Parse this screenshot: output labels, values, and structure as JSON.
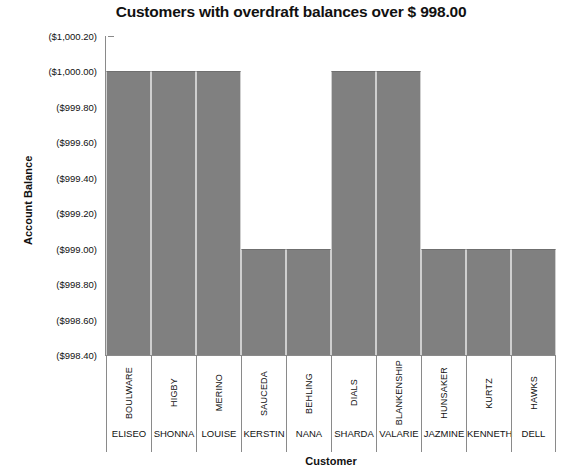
{
  "chart_data": {
    "type": "bar",
    "title": "Customers with overdraft balances over $ 998.00",
    "xlabel": "Customer",
    "ylabel": "Account Balance",
    "ylim": [
      -1000.2,
      -998.4
    ],
    "y_axis_inverted": true,
    "grid": false,
    "legend": "none",
    "y_tick_labels": [
      "($1,000.20)",
      "($1,000.00)",
      "($999.80)",
      "($999.60)",
      "($999.40)",
      "($999.20)",
      "($999.00)",
      "($998.80)",
      "($998.60)",
      "($998.40)"
    ],
    "y_tick_values": [
      -1000.2,
      -1000.0,
      -999.8,
      -999.6,
      -999.4,
      -999.2,
      -999.0,
      -998.8,
      -998.6,
      -998.4
    ],
    "categories": [
      {
        "last_name": "BOULWARE",
        "first_name": "ELISEO"
      },
      {
        "last_name": "HIGBY",
        "first_name": "SHONNA"
      },
      {
        "last_name": "MERINO",
        "first_name": "LOUISE"
      },
      {
        "last_name": "SAUCEDA",
        "first_name": "KERSTIN"
      },
      {
        "last_name": "BEHLING",
        "first_name": "NANA"
      },
      {
        "last_name": "DIALS",
        "first_name": "SHARDA"
      },
      {
        "last_name": "BLANKENSHIP",
        "first_name": "VALARIE"
      },
      {
        "last_name": "HUNSAKER",
        "first_name": "JAZMINE"
      },
      {
        "last_name": "KURTZ",
        "first_name": "KENNETH"
      },
      {
        "last_name": "HAWKS",
        "first_name": "DELL"
      }
    ],
    "values": [
      -1000.0,
      -1000.0,
      -1000.0,
      -999.0,
      -999.0,
      -1000.0,
      -1000.0,
      -999.0,
      -999.0,
      -999.0
    ],
    "bar_color": "#808080",
    "axis_color": "#8a8a8a",
    "text_color": "#111111"
  }
}
